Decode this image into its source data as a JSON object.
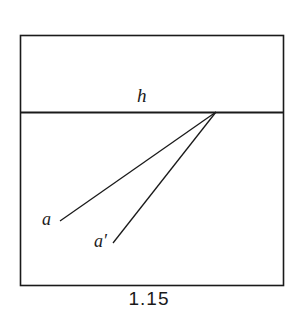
{
  "figure": {
    "caption": "1.15",
    "background_color": "#ffffff",
    "ink_color": "#1a1a1a",
    "frame": {
      "name": "picture-frame",
      "x": 20,
      "y": 35,
      "width": 263,
      "height": 250
    },
    "horizon": {
      "label": "h",
      "name": "horizon-line",
      "x1": 20,
      "y1": 112,
      "x2": 283,
      "y2": 112
    },
    "vanishing_point": {
      "x": 216,
      "y": 112
    },
    "rays": [
      {
        "label": "a",
        "name": "ray-a",
        "x1": 60,
        "y1": 221,
        "x2": 216,
        "y2": 112
      },
      {
        "label": "a'",
        "name": "ray-a-prime",
        "x1": 113,
        "y1": 243,
        "x2": 216,
        "y2": 112
      }
    ],
    "labels": {
      "horizon": "h",
      "point_a": "a",
      "point_a_prime": "a′"
    }
  }
}
